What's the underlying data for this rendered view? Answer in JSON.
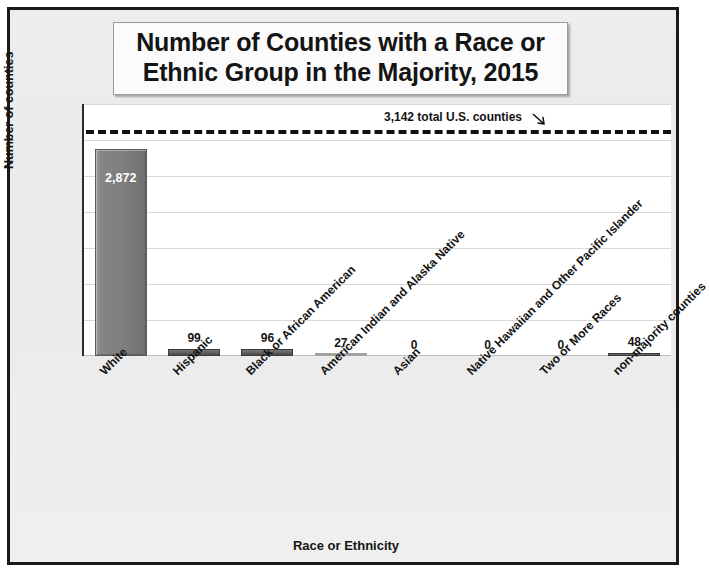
{
  "title": {
    "line1": "Number of Counties with a Race or",
    "line2": "Ethnic Group in the Majority, 2015"
  },
  "chart_data": {
    "type": "bar",
    "title": "Number of Counties with a Race or Ethnic Group in the Majority, 2015",
    "xlabel": "Race or Ethnicity",
    "ylabel": "Number of counties",
    "ylim": [
      0,
      3500
    ],
    "ytick_labels": [
      "3,500",
      "3,000",
      "2,500",
      "2,000",
      "1,500",
      "1,000",
      "500",
      "0"
    ],
    "ytick_values": [
      3500,
      3000,
      2500,
      2000,
      1500,
      1000,
      500,
      0
    ],
    "grid": true,
    "legend": "none",
    "categories": [
      "White",
      "Hispanic",
      "Black or African American",
      "American Indian and Alaska Native",
      "Asian",
      "Native Hawaiian and Other Pacific Islander",
      "Two or More Races",
      "non-majority counties"
    ],
    "values": [
      2872,
      99,
      96,
      27,
      0,
      0,
      0,
      48
    ],
    "value_labels": [
      "2,872",
      "99",
      "96",
      "27",
      "0",
      "0",
      "0",
      "48"
    ],
    "bar_color": "#808080",
    "reference_line": {
      "value": 3142,
      "label": "3,142 total U.S. counties",
      "style": "dashed",
      "color": "#111111"
    }
  }
}
